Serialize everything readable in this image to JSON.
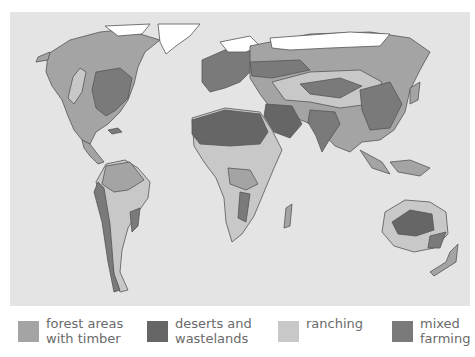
{
  "map": {
    "type": "world-land-use-map",
    "background_color": "#e4e4e4",
    "ice_color": "#ffffff",
    "coast_color": "#555555"
  },
  "legend": {
    "items": [
      {
        "key": "forest",
        "label": "forest areas\nwith timber",
        "color": "#a4a4a4"
      },
      {
        "key": "desert",
        "label": "deserts and\nwastelands",
        "color": "#666666"
      },
      {
        "key": "ranching",
        "label": "ranching",
        "color": "#c8c8c8"
      },
      {
        "key": "mixed",
        "label": "mixed\nfarming",
        "color": "#7a7a7a"
      }
    ]
  }
}
